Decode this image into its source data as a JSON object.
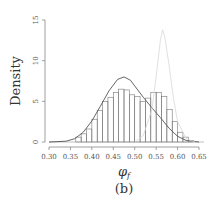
{
  "chart_data": {
    "type": "bar",
    "title": "",
    "caption": "(b)",
    "xlabel": "φ_f",
    "ylabel": "Density",
    "xlim": [
      0.3,
      0.65
    ],
    "ylim": [
      0,
      15
    ],
    "xticks": [
      "0.30",
      "0.35",
      "0.40",
      "0.45",
      "0.50",
      "0.55",
      "0.60",
      "0.65"
    ],
    "yticks": [
      "0",
      "5",
      "10",
      "15"
    ],
    "grid": false,
    "histogram": {
      "bin_width": 0.0125,
      "bin_left_edges": [
        0.3625,
        0.375,
        0.3875,
        0.4,
        0.4125,
        0.425,
        0.4375,
        0.45,
        0.4625,
        0.475,
        0.4875,
        0.5,
        0.5125,
        0.525,
        0.5375,
        0.55,
        0.5625,
        0.575,
        0.5875,
        0.6,
        0.6125,
        0.625
      ],
      "values": [
        0.6,
        1.0,
        1.6,
        2.8,
        3.9,
        5.0,
        5.5,
        6.1,
        6.5,
        6.4,
        5.8,
        5.6,
        5.0,
        5.4,
        6.1,
        6.1,
        5.6,
        4.0,
        2.5,
        1.2,
        0.6,
        0.2
      ]
    },
    "series": [
      {
        "name": "density curve (dark)",
        "x": [
          0.3,
          0.34,
          0.36,
          0.38,
          0.4,
          0.42,
          0.44,
          0.46,
          0.475,
          0.49,
          0.5,
          0.52,
          0.54,
          0.56,
          0.58,
          0.6,
          0.62,
          0.64,
          0.65
        ],
        "values": [
          0.0,
          0.1,
          0.4,
          1.2,
          2.6,
          4.4,
          6.3,
          7.7,
          8.0,
          7.6,
          6.9,
          5.5,
          4.2,
          3.0,
          1.7,
          0.7,
          0.2,
          0.05,
          0.0
        ]
      },
      {
        "name": "density curve (light)",
        "x": [
          0.5,
          0.52,
          0.54,
          0.55,
          0.56,
          0.565,
          0.57,
          0.58,
          0.59,
          0.6,
          0.62,
          0.64
        ],
        "values": [
          0.0,
          0.8,
          4.0,
          8.0,
          12.5,
          13.8,
          13.0,
          9.5,
          5.5,
          2.5,
          0.4,
          0.0
        ]
      }
    ]
  }
}
